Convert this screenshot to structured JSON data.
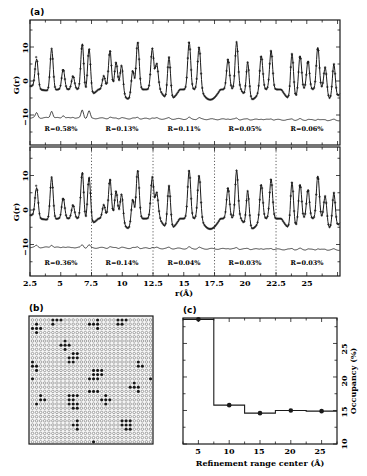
{
  "chart_data": [
    {
      "panel": "(a)",
      "subplot": "top",
      "type": "line",
      "title": "",
      "xlabel": "r(Å)",
      "ylabel": "G(r)",
      "xlim": [
        2.5,
        27.7
      ],
      "ylim": [
        -18,
        18
      ],
      "yticks": [
        -10,
        0,
        10
      ],
      "baseline_offset": -11,
      "series": [
        {
          "name": "data (crosses)",
          "style": "markers"
        },
        {
          "name": "fit",
          "style": "line"
        },
        {
          "name": "difference (offset)",
          "style": "line"
        }
      ],
      "peaks": [
        {
          "r": 3.04,
          "g": 6.5
        },
        {
          "r": 4.26,
          "g": 9.5
        },
        {
          "r": 5.2,
          "g": 3.5
        },
        {
          "r": 6.0,
          "g": 1.5
        },
        {
          "r": 6.75,
          "g": 11
        },
        {
          "r": 7.3,
          "g": 9.5
        },
        {
          "r": 8.5,
          "g": 1.5
        },
        {
          "r": 9.0,
          "g": 9
        },
        {
          "r": 9.5,
          "g": 5.5
        },
        {
          "r": 9.95,
          "g": 4.5
        },
        {
          "r": 10.85,
          "g": 3
        },
        {
          "r": 11.25,
          "g": 11.5
        },
        {
          "r": 12.44,
          "g": 9.5
        },
        {
          "r": 12.8,
          "g": 5
        },
        {
          "r": 13.8,
          "g": 7
        },
        {
          "r": 15.44,
          "g": 11.5
        },
        {
          "r": 16.25,
          "g": 10
        },
        {
          "r": 18.6,
          "g": 6.5
        },
        {
          "r": 19.3,
          "g": 11.5
        },
        {
          "r": 20.2,
          "g": 5.5
        },
        {
          "r": 21.3,
          "g": 7.5
        },
        {
          "r": 22.1,
          "g": 9
        },
        {
          "r": 23.8,
          "g": 8
        },
        {
          "r": 24.45,
          "g": 7.5
        },
        {
          "r": 25.1,
          "g": 6
        },
        {
          "r": 25.9,
          "g": 10
        },
        {
          "r": 26.5,
          "g": 4
        },
        {
          "r": 27.2,
          "g": 5
        }
      ],
      "range_boundaries": [],
      "annotations": [
        {
          "text": "R=0.58%",
          "r_center": 5.0
        },
        {
          "text": "R=0.13%",
          "r_center": 10.0
        },
        {
          "text": "R=0.11%",
          "r_center": 15.0
        },
        {
          "text": "R=0.05%",
          "r_center": 20.0
        },
        {
          "text": "R=0.06%",
          "r_center": 25.0
        }
      ]
    },
    {
      "panel": "(a)",
      "subplot": "bottom",
      "type": "line",
      "xlabel": "r(Å)",
      "ylabel": "G(r)",
      "xlim": [
        2.5,
        27.7
      ],
      "ylim": [
        -18,
        18
      ],
      "xticks": [
        2.5,
        5,
        7.5,
        10,
        12.5,
        15,
        17.5,
        20,
        22.5,
        25
      ],
      "yticks": [
        -10,
        0,
        10
      ],
      "range_boundaries": [
        7.5,
        12.5,
        17.5,
        22.5
      ],
      "annotations": [
        {
          "text": "R=0.36%",
          "r_center": 5.0
        },
        {
          "text": "R=0.14%",
          "r_center": 10.0
        },
        {
          "text": "R=0.04%",
          "r_center": 15.0
        },
        {
          "text": "R=0.03%",
          "r_center": 20.0
        },
        {
          "text": "R=0.03%",
          "r_center": 25.0
        }
      ]
    },
    {
      "panel": "(b)",
      "type": "heatmap",
      "title": "",
      "description": "30x30 site-occupancy lattice: filled circles = occupied, open circles = vacant",
      "rows": 30,
      "cols": 30
    },
    {
      "panel": "(c)",
      "type": "line",
      "title": "",
      "xlabel": "Refinement range center (Å)",
      "ylabel": "Occupancy (%)",
      "ylabel_side": "right",
      "xlim": [
        2.5,
        27.5
      ],
      "ylim": [
        10,
        28.8
      ],
      "xticks": [
        5,
        10,
        15,
        20,
        25
      ],
      "yticks": [
        10,
        15,
        20,
        25
      ],
      "x": [
        5,
        10,
        15,
        20,
        25
      ],
      "values": [
        28.6,
        15.8,
        14.6,
        15.0,
        14.9
      ],
      "step": {
        "edges": [
          2.5,
          7.5,
          12.5,
          17.5,
          22.5,
          27.5
        ],
        "levels": [
          28.6,
          15.8,
          14.6,
          15.0,
          14.9
        ]
      }
    }
  ],
  "labels": {
    "panel_a": "(a)",
    "panel_b": "(b)",
    "panel_c": "(c)",
    "ylabel_a": "G(r)",
    "xlabel_a": "r(Å)",
    "xlabel_c": "Refinement range center (Å)",
    "ylabel_c": "Occupancy (%)",
    "top_R": [
      "R=0.58%",
      "R=0.13%",
      "R=0.11%",
      "R=0.05%",
      "R=0.06%"
    ],
    "bottom_R": [
      "R=0.36%",
      "R=0.14%",
      "R=0.04%",
      "R=0.03%",
      "R=0.03%"
    ],
    "xticks_a": [
      "2.5",
      "5",
      "7.5",
      "10",
      "12.5",
      "15",
      "17.5",
      "20",
      "22.5",
      "25"
    ],
    "yticks_a": [
      "10",
      "0",
      "−10"
    ],
    "xticks_c": [
      "5",
      "10",
      "15",
      "20",
      "25"
    ],
    "yticks_c": [
      "10",
      "15",
      "20",
      "25"
    ]
  },
  "colors": {
    "ink": "#1a1a1a",
    "background": "#ffffff"
  }
}
